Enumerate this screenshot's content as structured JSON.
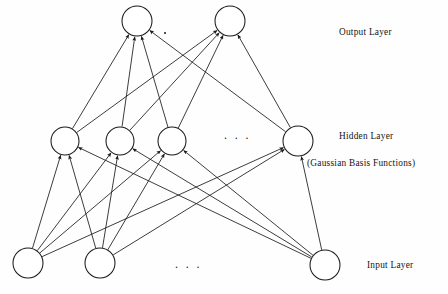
{
  "figure": {
    "type": "neural-network-diagram",
    "background_color": "#fefefe",
    "stroke_color": "#1a1a1a"
  },
  "labels": {
    "output_layer": "Output Layer",
    "hidden_layer": "Hidden Layer",
    "hidden_sublabel": "(Gaussian Basis Functions)",
    "input_layer": "Input Layer",
    "hidden_ellipsis": ". . .",
    "input_ellipsis": ". . ."
  },
  "network": {
    "node_radius": 15,
    "hidden_node_radius": 14,
    "layers": [
      {
        "name": "output",
        "label": "Output Layer",
        "y": 21,
        "nodes": [
          {
            "id": "o1",
            "cx": 137,
            "cy": 21,
            "r": 15
          },
          {
            "id": "o2",
            "cx": 230,
            "cy": 21,
            "r": 15
          }
        ]
      },
      {
        "name": "hidden",
        "label": "Hidden Layer",
        "sublabel": "(Gaussian Basis Functions)",
        "y": 141,
        "nodes": [
          {
            "id": "h1",
            "cx": 65,
            "cy": 141,
            "r": 14
          },
          {
            "id": "h2",
            "cx": 120,
            "cy": 141,
            "r": 14
          },
          {
            "id": "h3",
            "cx": 172,
            "cy": 141,
            "r": 14
          },
          {
            "id": "h4",
            "cx": 298,
            "cy": 141,
            "r": 15
          }
        ]
      },
      {
        "name": "input",
        "label": "Input Layer",
        "y": 263,
        "nodes": [
          {
            "id": "i1",
            "cx": 28,
            "cy": 263,
            "r": 15
          },
          {
            "id": "i2",
            "cx": 100,
            "cy": 263,
            "r": 15
          },
          {
            "id": "i3",
            "cx": 325,
            "cy": 265,
            "r": 15
          }
        ]
      }
    ],
    "edges_input_to_hidden": [
      {
        "from": "i1",
        "to": "h1"
      },
      {
        "from": "i1",
        "to": "h2"
      },
      {
        "from": "i1",
        "to": "h3"
      },
      {
        "from": "i1",
        "to": "h4"
      },
      {
        "from": "i2",
        "to": "h1"
      },
      {
        "from": "i2",
        "to": "h2"
      },
      {
        "from": "i2",
        "to": "h3"
      },
      {
        "from": "i2",
        "to": "h4"
      },
      {
        "from": "i3",
        "to": "h1"
      },
      {
        "from": "i3",
        "to": "h2"
      },
      {
        "from": "i3",
        "to": "h3"
      },
      {
        "from": "i3",
        "to": "h4"
      }
    ],
    "edges_hidden_to_output": [
      {
        "from": "h1",
        "to": "o1"
      },
      {
        "from": "h1",
        "to": "o2"
      },
      {
        "from": "h2",
        "to": "o1"
      },
      {
        "from": "h2",
        "to": "o2"
      },
      {
        "from": "h3",
        "to": "o1"
      },
      {
        "from": "h3",
        "to": "o2"
      },
      {
        "from": "h4",
        "to": "o1"
      },
      {
        "from": "h4",
        "to": "o2"
      }
    ],
    "edge_direction": "arrows point from input toward output (feedforward)"
  }
}
